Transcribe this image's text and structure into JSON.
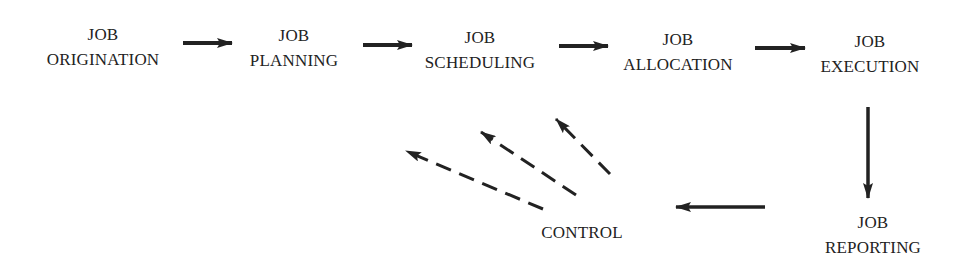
{
  "diagram": {
    "type": "flowchart",
    "colors": {
      "ink": "#222222",
      "background": "#ffffff"
    },
    "nodes": [
      {
        "id": "origination",
        "line1": "JOB",
        "line2": "ORIGINATION"
      },
      {
        "id": "planning",
        "line1": "JOB",
        "line2": "PLANNING"
      },
      {
        "id": "scheduling",
        "line1": "JOB",
        "line2": "SCHEDULING"
      },
      {
        "id": "allocation",
        "line1": "JOB",
        "line2": "ALLOCATION"
      },
      {
        "id": "execution",
        "line1": "JOB",
        "line2": "EXECUTION"
      },
      {
        "id": "reporting",
        "line1": "JOB",
        "line2": "REPORTING"
      },
      {
        "id": "control",
        "line1": "CONTROL"
      }
    ],
    "edges": [
      {
        "from": "origination",
        "to": "planning",
        "style": "solid"
      },
      {
        "from": "planning",
        "to": "scheduling",
        "style": "solid"
      },
      {
        "from": "scheduling",
        "to": "allocation",
        "style": "solid"
      },
      {
        "from": "allocation",
        "to": "execution",
        "style": "solid"
      },
      {
        "from": "execution",
        "to": "reporting",
        "style": "solid"
      },
      {
        "from": "reporting",
        "to": "control",
        "style": "solid"
      },
      {
        "from": "control",
        "to": "origination",
        "style": "dashed"
      },
      {
        "from": "control",
        "to": "planning",
        "style": "dashed"
      },
      {
        "from": "control",
        "to": "scheduling",
        "style": "dashed"
      }
    ]
  }
}
